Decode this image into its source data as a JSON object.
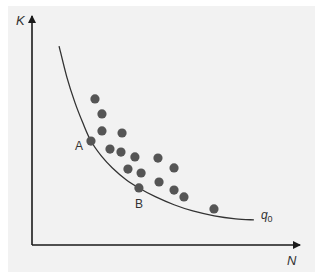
{
  "chart_data": {
    "type": "scatter",
    "title": "",
    "xlabel": "N",
    "ylabel": "K",
    "xlim": [
      0,
      10
    ],
    "ylim": [
      0,
      10
    ],
    "grid": false,
    "ticks": "none",
    "colors": {
      "panel": "#f2f2f2",
      "axis": "#1a1a1a",
      "points": "#555555",
      "curve": "#333333",
      "text": "#333333"
    },
    "points": [
      {
        "n": 2.35,
        "k": 6.35
      },
      {
        "n": 2.61,
        "k": 5.7
      },
      {
        "n": 2.61,
        "k": 4.96
      },
      {
        "n": 3.36,
        "k": 4.87
      },
      {
        "n": 2.91,
        "k": 4.17
      },
      {
        "n": 3.32,
        "k": 4.04
      },
      {
        "n": 3.84,
        "k": 3.83
      },
      {
        "n": 4.7,
        "k": 3.78
      },
      {
        "n": 3.58,
        "k": 3.3
      },
      {
        "n": 4.07,
        "k": 3.13
      },
      {
        "n": 5.3,
        "k": 3.35
      },
      {
        "n": 4.74,
        "k": 2.74
      },
      {
        "n": 5.3,
        "k": 2.39
      },
      {
        "n": 5.67,
        "k": 2.09
      },
      {
        "n": 6.79,
        "k": 1.57
      }
    ],
    "labeled_points": [
      {
        "label": "A",
        "n": 2.2,
        "k": 4.52,
        "label_side": "left"
      },
      {
        "label": "B",
        "n": 3.99,
        "k": 2.48,
        "label_side": "below"
      }
    ],
    "curve": {
      "name": "q",
      "subscript": "0",
      "points": [
        {
          "n": 1.01,
          "k": 8.65
        },
        {
          "n": 1.3,
          "k": 7.3
        },
        {
          "n": 1.6,
          "k": 6.2
        },
        {
          "n": 1.9,
          "k": 5.3
        },
        {
          "n": 2.2,
          "k": 4.52
        },
        {
          "n": 2.6,
          "k": 3.85
        },
        {
          "n": 3.0,
          "k": 3.35
        },
        {
          "n": 3.5,
          "k": 2.85
        },
        {
          "n": 3.99,
          "k": 2.48
        },
        {
          "n": 4.6,
          "k": 2.1
        },
        {
          "n": 5.3,
          "k": 1.75
        },
        {
          "n": 6.0,
          "k": 1.48
        },
        {
          "n": 6.8,
          "k": 1.27
        },
        {
          "n": 7.6,
          "k": 1.14
        },
        {
          "n": 8.28,
          "k": 1.09
        }
      ]
    }
  }
}
